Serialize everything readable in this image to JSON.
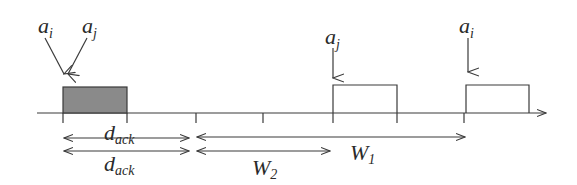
{
  "diagram": {
    "type": "timeline",
    "colors": {
      "line": "#3a3a3a",
      "filled_box": "#8a8a8a",
      "text": "#2a2a2a"
    },
    "arrivals": [
      {
        "base": "a",
        "sub": "i",
        "position": "first"
      },
      {
        "base": "a",
        "sub": "j",
        "position": "first"
      },
      {
        "base": "a",
        "sub": "j",
        "position": "second"
      },
      {
        "base": "a",
        "sub": "i",
        "position": "third"
      }
    ],
    "boxes": [
      {
        "name": "ack-box",
        "filled": true
      },
      {
        "name": "aj-box",
        "filled": false
      },
      {
        "name": "ai-box",
        "filled": false
      }
    ],
    "intervals": [
      {
        "label_base": "d",
        "label_sub": "ack"
      },
      {
        "label_base": "d",
        "label_sub": "ack"
      },
      {
        "label_base": "W",
        "label_sub": "2"
      },
      {
        "label_base": "W",
        "label_sub": "1"
      }
    ]
  }
}
